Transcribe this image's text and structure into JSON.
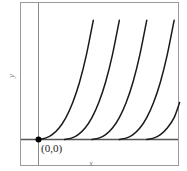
{
  "figure": {
    "background_color": "#ffffff",
    "frame_color": "#9a9a9a",
    "axis_color": "#555555",
    "curve_color": "#1a1a1a",
    "point_color": "#000000"
  },
  "labels": {
    "x_axis": "x",
    "y_axis": "y",
    "origin": "(0,0)"
  },
  "chart_data": {
    "type": "line",
    "title": "",
    "subtitle": "",
    "xlabel": "x",
    "ylabel": "y",
    "annotations": [
      {
        "text": "(0,0)",
        "x": 0,
        "y": 0,
        "marker": "filled-dot"
      }
    ],
    "grid": false,
    "legend": null,
    "xlim": [
      -0.35,
      5.2
    ],
    "ylim": [
      -0.55,
      5.2
    ],
    "series": [
      {
        "name": "curve-1",
        "x_intercept": 0.0,
        "points": [
          [
            0.0,
            0.0
          ],
          [
            0.25,
            0.05
          ],
          [
            0.5,
            0.18
          ],
          [
            0.75,
            0.42
          ],
          [
            1.0,
            0.8
          ],
          [
            1.25,
            1.35
          ],
          [
            1.5,
            2.1
          ],
          [
            1.75,
            3.1
          ],
          [
            2.0,
            4.35
          ],
          [
            2.15,
            5.2
          ]
        ]
      },
      {
        "name": "curve-2",
        "x_intercept": 0.95,
        "points": [
          [
            0.95,
            0.0
          ],
          [
            1.2,
            0.05
          ],
          [
            1.45,
            0.18
          ],
          [
            1.7,
            0.42
          ],
          [
            1.95,
            0.8
          ],
          [
            2.2,
            1.35
          ],
          [
            2.45,
            2.1
          ],
          [
            2.7,
            3.1
          ],
          [
            2.95,
            4.35
          ],
          [
            3.1,
            5.2
          ]
        ]
      },
      {
        "name": "curve-3",
        "x_intercept": 1.95,
        "points": [
          [
            1.95,
            0.0
          ],
          [
            2.2,
            0.05
          ],
          [
            2.45,
            0.18
          ],
          [
            2.7,
            0.42
          ],
          [
            2.95,
            0.8
          ],
          [
            3.2,
            1.35
          ],
          [
            3.45,
            2.1
          ],
          [
            3.7,
            3.1
          ],
          [
            3.95,
            4.35
          ],
          [
            4.1,
            5.2
          ]
        ]
      },
      {
        "name": "curve-4",
        "x_intercept": 2.95,
        "points": [
          [
            2.95,
            0.0
          ],
          [
            3.2,
            0.05
          ],
          [
            3.45,
            0.18
          ],
          [
            3.7,
            0.42
          ],
          [
            3.95,
            0.8
          ],
          [
            4.2,
            1.35
          ],
          [
            4.45,
            2.1
          ],
          [
            4.7,
            3.1
          ],
          [
            4.95,
            4.35
          ],
          [
            5.1,
            5.2
          ]
        ]
      },
      {
        "name": "curve-5",
        "x_intercept": 3.95,
        "points": [
          [
            3.95,
            0.0
          ],
          [
            4.2,
            0.05
          ],
          [
            4.45,
            0.18
          ],
          [
            4.7,
            0.42
          ],
          [
            4.95,
            0.8
          ],
          [
            5.15,
            1.35
          ],
          [
            5.2,
            2.6
          ]
        ]
      }
    ]
  }
}
